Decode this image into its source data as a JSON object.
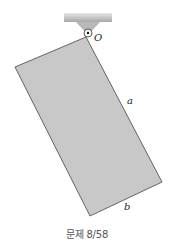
{
  "figure": {
    "pivot_label": "O",
    "side_a_label": "a",
    "side_b_label": "b",
    "caption": "문제 8/58",
    "colors": {
      "plate_fill": "#c8c8c8",
      "plate_edge": "#555555",
      "support_fill": "#b5b5b5",
      "ceiling_fill": "#c4c4c4"
    },
    "plate_corners": {
      "top": [
        86,
        37
      ],
      "left": [
        15,
        67
      ],
      "bottom": [
        90,
        216
      ],
      "right": [
        162,
        182
      ]
    }
  }
}
